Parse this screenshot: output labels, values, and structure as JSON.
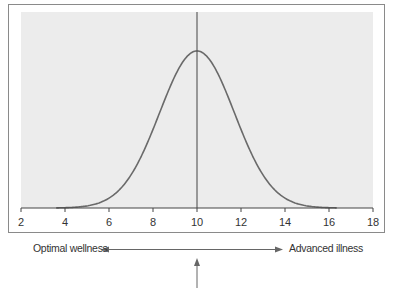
{
  "chart_data": {
    "type": "line",
    "title": "",
    "xlabel": "",
    "ylabel": "",
    "xlim": [
      2,
      18
    ],
    "x_ticks": [
      2,
      4,
      6,
      8,
      10,
      12,
      14,
      16,
      18
    ],
    "x_tick_labels": [
      "2",
      "4",
      "6",
      "8",
      "10",
      "12",
      "14",
      "16",
      "18"
    ],
    "series": [
      {
        "name": "normal distribution curve",
        "distribution": "normal",
        "mean": 10,
        "std": 1.7,
        "x": [
          4,
          5,
          6,
          7,
          8,
          9,
          10,
          11,
          12,
          13,
          14,
          15,
          16
        ],
        "values": [
          0.002,
          0.013,
          0.063,
          0.211,
          0.501,
          0.841,
          1.0,
          0.841,
          0.501,
          0.211,
          0.063,
          0.013,
          0.002
        ]
      }
    ],
    "vertical_line": {
      "x": 10
    },
    "grid": false,
    "plot_background": "#ececec",
    "annotations": {
      "left_label": "Optimal wellness",
      "right_label": "Advanced illness",
      "double_arrow": "horizontal",
      "pointer_arrow": "up, below x=10"
    }
  },
  "labels": {
    "left": "Optimal wellness",
    "right": "Advanced illness"
  },
  "colors": {
    "plot_bg": "#ececec",
    "curve": "#6a6a6a",
    "line": "#444444",
    "frame": "#8a8a8a"
  }
}
